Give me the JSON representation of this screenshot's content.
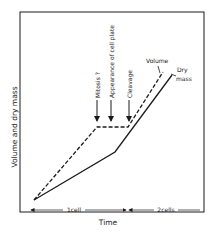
{
  "diagram": {
    "y_axis_label": "Volume and dry mass",
    "x_axis_label": "Time",
    "events": [
      {
        "label": "Mitosis ?",
        "x": 97
      },
      {
        "label": "Appearance of cell plate",
        "x": 111
      },
      {
        "label": "Cleavage",
        "x": 129
      }
    ],
    "curves": [
      {
        "name": "Volume",
        "style": "dashed",
        "label": "Volume"
      },
      {
        "name": "Dry mass",
        "style": "solid",
        "label_line1": "Dry",
        "label_line2": "mass"
      }
    ],
    "phases": [
      {
        "label": "1cell"
      },
      {
        "label": "2cells"
      }
    ],
    "colors": {
      "ink": "#1a1a1a",
      "background": "#ffffff"
    }
  }
}
